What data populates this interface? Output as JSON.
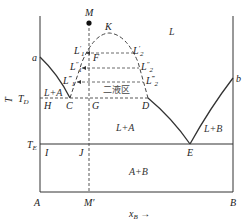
{
  "figure": {
    "type": "binary phase diagram with liquid miscibility gap",
    "axes": {
      "y_label": "T",
      "x_label": "x",
      "x_label_sub": "B",
      "x_arrow": "→",
      "left_corner": "A",
      "right_corner": "B"
    },
    "points": {
      "a": "a",
      "b": "b",
      "M": "M",
      "M_prime": "M′",
      "K": "K",
      "F": "F",
      "C": "C",
      "D": "D",
      "G": "G",
      "H": "H",
      "E": "E",
      "I": "I",
      "J": "J"
    },
    "temperatures": {
      "TD": "T",
      "TD_sub": "D",
      "TE": "T",
      "TE_sub": "E"
    },
    "tie_line_labels": {
      "L1p": "L",
      "L1p_sub": "1",
      "L1p_sup": "′",
      "L1pp": "L",
      "L1pp_sub": "1",
      "L1pp_sup": "″",
      "L1ppp": "L",
      "L1ppp_sub": "1",
      "L1ppp_sup": "‴",
      "L2p": "L",
      "L2p_sub": "2",
      "L2p_sup": "′",
      "L2pp": "L",
      "L2pp_sub": "2",
      "L2pp_sup": "″",
      "L2ppp": "L",
      "L2ppp_sub": "2",
      "L2ppp_sup": "‴"
    },
    "regions": {
      "liquid": "L",
      "two_liquid": "二液区",
      "L_plus_A_upper": "L+A",
      "L_plus_A_lower": "L+A",
      "L_plus_B": "L+B",
      "A_plus_B": "A+B"
    },
    "colors": {
      "line": "#333333",
      "dashed": "#444444",
      "background": "#ffffff"
    }
  }
}
